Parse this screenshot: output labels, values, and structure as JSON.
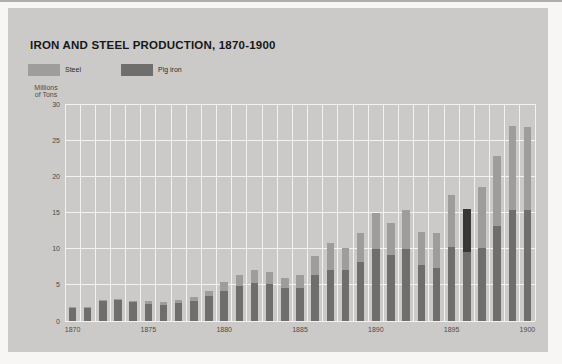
{
  "title": "IRON AND STEEL PRODUCTION, 1870-1900",
  "y_axis": {
    "title_line1": "Millions",
    "title_line2": "of Tons",
    "ticks": [
      0,
      5,
      10,
      15,
      20,
      25,
      30
    ]
  },
  "x_axis": {
    "labeled_years": [
      1870,
      1875,
      1880,
      1885,
      1890,
      1895,
      1900
    ]
  },
  "legend": [
    {
      "label": "Steel",
      "color": "#9e9d9b"
    },
    {
      "label": "Pig iron",
      "color": "#6f6e6c"
    }
  ],
  "colors": {
    "panel_background": "#cbcac8",
    "page_background": "#f7f6f4",
    "gridline": "#f3f2f0",
    "steel_bar": "#9e9d9b",
    "pig_iron_bar": "#6f6e6c",
    "anomalous_dark_segment": "#393735",
    "title_text": "#171717",
    "axis_text": "#4a4a4a"
  },
  "chart_data": {
    "type": "bar",
    "stacked": true,
    "title": "IRON AND STEEL PRODUCTION, 1870-1900",
    "ylabel": "Millions of Tons",
    "ylim": [
      0,
      30
    ],
    "grid": true,
    "legend_position": "top-left",
    "categories": [
      1870,
      1871,
      1872,
      1873,
      1874,
      1875,
      1876,
      1877,
      1878,
      1879,
      1880,
      1881,
      1882,
      1883,
      1884,
      1885,
      1886,
      1887,
      1888,
      1889,
      1890,
      1891,
      1892,
      1893,
      1894,
      1895,
      1896,
      1897,
      1898,
      1899,
      1900
    ],
    "series": [
      {
        "name": "Pig iron",
        "color": "#6f6e6c",
        "values": [
          1.8,
          1.8,
          2.8,
          2.9,
          2.6,
          2.4,
          2.2,
          2.5,
          2.8,
          3.4,
          4.2,
          4.9,
          5.2,
          5.1,
          4.5,
          4.6,
          6.3,
          7.1,
          7.0,
          8.2,
          10.0,
          9.1,
          9.9,
          7.8,
          7.3,
          10.2,
          9.5,
          10.1,
          13.2,
          15.3,
          15.3
        ]
      },
      {
        "name": "Steel",
        "color": "#9e9d9b",
        "values": [
          0.1,
          0.1,
          0.1,
          0.2,
          0.2,
          0.3,
          0.4,
          0.4,
          0.5,
          0.7,
          1.2,
          1.4,
          1.8,
          1.7,
          1.5,
          1.8,
          2.7,
          3.7,
          3.1,
          4.0,
          5.0,
          4.4,
          5.5,
          4.5,
          4.9,
          7.2,
          6.0,
          8.4,
          9.6,
          11.6,
          11.5
        ]
      }
    ],
    "segment_color_overrides": [
      {
        "year": 1896,
        "series": "Steel",
        "color": "#393735"
      }
    ]
  }
}
